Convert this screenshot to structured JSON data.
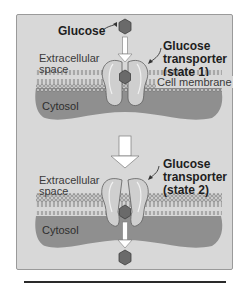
{
  "figure": {
    "panel1": {
      "glucose_label": "Glucose",
      "extracellular_label": [
        "Extracellular",
        "space"
      ],
      "transporter_label": [
        "Glucose",
        "transporter",
        "(state 1)"
      ],
      "membrane_label": "Cell membrane",
      "cytosol_label": "Cytosol"
    },
    "panel2": {
      "extracellular_label": [
        "Extracellular",
        "space"
      ],
      "transporter_label": [
        "Glucose",
        "transporter",
        "(state 2)"
      ],
      "cytosol_label": "Cytosol"
    }
  },
  "colors": {
    "background": "#d8d8d8",
    "cytosol": "#8f8f8f",
    "glucose": "#6a6a6a",
    "transporter": "#c8c8c8",
    "membrane": "#b0b0b0"
  }
}
